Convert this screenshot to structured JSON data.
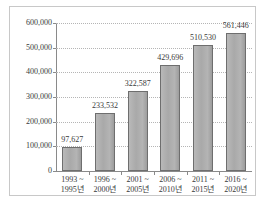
{
  "chart_data": {
    "type": "bar",
    "title": "",
    "subtitle": "",
    "xlabel": "",
    "ylabel": "",
    "ylim": [
      0,
      600000
    ],
    "ytick_values": [
      0,
      100000,
      200000,
      300000,
      400000,
      500000,
      600000
    ],
    "ytick_labels": [
      "0",
      "100,000",
      "200,000",
      "300,000",
      "400,000",
      "500,000",
      "600,000"
    ],
    "grid": true,
    "legend": false,
    "categories": [
      {
        "line1": "1993 ~",
        "line2": "1995년"
      },
      {
        "line1": "1996 ~",
        "line2": "2000년"
      },
      {
        "line1": "2001 ~",
        "line2": "2005년"
      },
      {
        "line1": "2006 ~",
        "line2": "2010년"
      },
      {
        "line1": "2011 ~",
        "line2": "2015년"
      },
      {
        "line1": "2016 ~",
        "line2": "2020년"
      }
    ],
    "values": [
      97627,
      233532,
      322587,
      429696,
      510530,
      561446
    ],
    "value_labels": [
      "97,627",
      "233,532",
      "322,587",
      "429,696",
      "510,530",
      "561,446"
    ],
    "bar_color": "#adadad",
    "bar_border_color": "#6e6e6e",
    "grid_color": "#b5b5b5",
    "axis_color": "#8a8a8a",
    "text_color": "#3a3a3a",
    "background": "#ffffff",
    "frame_color": "#c8c8c8"
  }
}
